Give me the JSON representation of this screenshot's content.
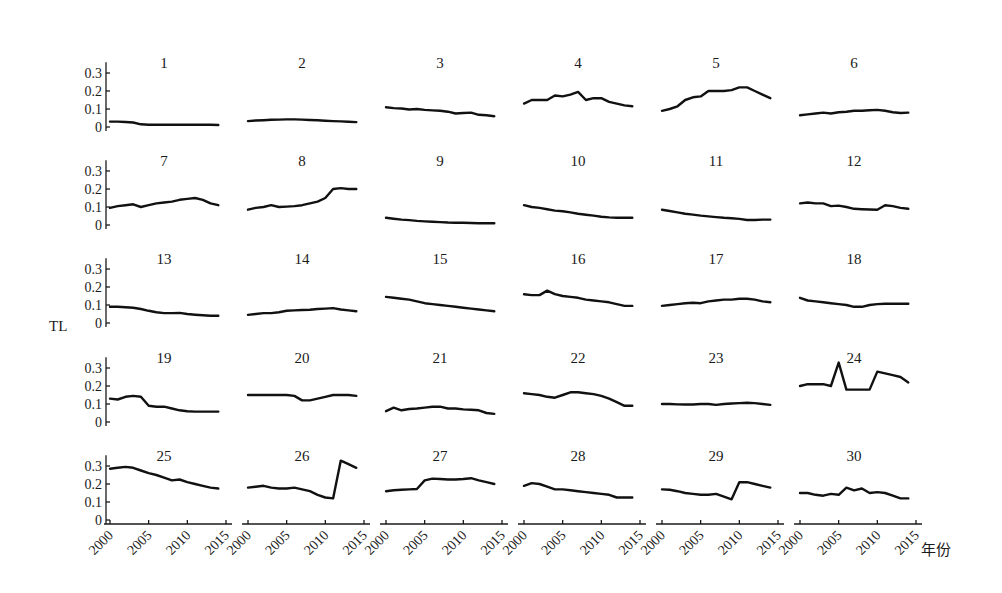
{
  "chart_data": {
    "type": "line",
    "layout": "small-multiples",
    "grid_rows": 5,
    "grid_cols": 6,
    "ylabel": "TL",
    "xlabel": "年份",
    "ylim": [
      0,
      0.35
    ],
    "yticks": [
      "0",
      "0.1",
      "0.2",
      "0.3"
    ],
    "xticks": [
      "2000",
      "2005",
      "2010",
      "2015"
    ],
    "x": [
      2000,
      2001,
      2002,
      2003,
      2004,
      2005,
      2006,
      2007,
      2008,
      2009,
      2010,
      2011,
      2012,
      2013,
      2014
    ],
    "grid": false,
    "legend": "none",
    "panels": [
      {
        "title": "1",
        "values": [
          0.03,
          0.03,
          0.028,
          0.025,
          0.015,
          0.013,
          0.013,
          0.013,
          0.013,
          0.013,
          0.013,
          0.013,
          0.013,
          0.012,
          0.011
        ]
      },
      {
        "title": "2",
        "values": [
          0.033,
          0.036,
          0.038,
          0.04,
          0.041,
          0.042,
          0.042,
          0.041,
          0.039,
          0.037,
          0.035,
          0.033,
          0.031,
          0.029,
          0.027
        ]
      },
      {
        "title": "3",
        "values": [
          0.11,
          0.105,
          0.103,
          0.097,
          0.1,
          0.095,
          0.092,
          0.09,
          0.085,
          0.075,
          0.078,
          0.08,
          0.068,
          0.065,
          0.06
        ]
      },
      {
        "title": "4",
        "values": [
          0.13,
          0.15,
          0.15,
          0.15,
          0.175,
          0.17,
          0.18,
          0.195,
          0.15,
          0.16,
          0.16,
          0.14,
          0.13,
          0.12,
          0.115
        ]
      },
      {
        "title": "5",
        "values": [
          0.09,
          0.1,
          0.115,
          0.15,
          0.165,
          0.17,
          0.2,
          0.2,
          0.2,
          0.205,
          0.22,
          0.22,
          0.2,
          0.18,
          0.16
        ]
      },
      {
        "title": "6",
        "values": [
          0.065,
          0.07,
          0.075,
          0.08,
          0.075,
          0.082,
          0.085,
          0.09,
          0.09,
          0.093,
          0.095,
          0.09,
          0.082,
          0.078,
          0.08
        ]
      },
      {
        "title": "7",
        "values": [
          0.095,
          0.105,
          0.11,
          0.115,
          0.1,
          0.11,
          0.12,
          0.125,
          0.13,
          0.14,
          0.145,
          0.15,
          0.14,
          0.12,
          0.11
        ]
      },
      {
        "title": "8",
        "values": [
          0.085,
          0.095,
          0.1,
          0.11,
          0.1,
          0.102,
          0.105,
          0.11,
          0.12,
          0.13,
          0.15,
          0.2,
          0.205,
          0.2,
          0.2
        ]
      },
      {
        "title": "9",
        "values": [
          0.04,
          0.035,
          0.03,
          0.027,
          0.023,
          0.02,
          0.018,
          0.016,
          0.014,
          0.013,
          0.012,
          0.011,
          0.01,
          0.01,
          0.01
        ]
      },
      {
        "title": "10",
        "values": [
          0.11,
          0.1,
          0.095,
          0.088,
          0.08,
          0.076,
          0.07,
          0.062,
          0.057,
          0.052,
          0.046,
          0.042,
          0.04,
          0.04,
          0.04
        ]
      },
      {
        "title": "11",
        "values": [
          0.085,
          0.078,
          0.07,
          0.063,
          0.058,
          0.052,
          0.048,
          0.044,
          0.04,
          0.037,
          0.034,
          0.028,
          0.028,
          0.03,
          0.03
        ]
      },
      {
        "title": "12",
        "values": [
          0.12,
          0.125,
          0.12,
          0.12,
          0.105,
          0.108,
          0.1,
          0.09,
          0.088,
          0.086,
          0.085,
          0.11,
          0.105,
          0.095,
          0.09
        ]
      },
      {
        "title": "13",
        "values": [
          0.09,
          0.09,
          0.088,
          0.085,
          0.078,
          0.068,
          0.06,
          0.055,
          0.055,
          0.056,
          0.05,
          0.046,
          0.043,
          0.04,
          0.04
        ]
      },
      {
        "title": "14",
        "values": [
          0.045,
          0.05,
          0.055,
          0.055,
          0.06,
          0.068,
          0.07,
          0.072,
          0.074,
          0.078,
          0.08,
          0.083,
          0.075,
          0.07,
          0.065
        ]
      },
      {
        "title": "15",
        "values": [
          0.145,
          0.14,
          0.135,
          0.13,
          0.12,
          0.11,
          0.105,
          0.1,
          0.095,
          0.09,
          0.085,
          0.08,
          0.075,
          0.07,
          0.065
        ]
      },
      {
        "title": "16",
        "values": [
          0.16,
          0.155,
          0.155,
          0.18,
          0.16,
          0.15,
          0.145,
          0.14,
          0.13,
          0.125,
          0.12,
          0.115,
          0.105,
          0.095,
          0.095
        ]
      },
      {
        "title": "17",
        "values": [
          0.095,
          0.1,
          0.105,
          0.11,
          0.112,
          0.11,
          0.12,
          0.125,
          0.13,
          0.13,
          0.135,
          0.135,
          0.13,
          0.12,
          0.115
        ]
      },
      {
        "title": "18",
        "values": [
          0.14,
          0.125,
          0.12,
          0.115,
          0.11,
          0.105,
          0.1,
          0.09,
          0.09,
          0.1,
          0.105,
          0.107,
          0.107,
          0.107,
          0.107
        ]
      },
      {
        "title": "19",
        "values": [
          0.13,
          0.125,
          0.14,
          0.145,
          0.14,
          0.09,
          0.085,
          0.085,
          0.075,
          0.065,
          0.06,
          0.058,
          0.058,
          0.058,
          0.058
        ]
      },
      {
        "title": "20",
        "values": [
          0.15,
          0.15,
          0.15,
          0.15,
          0.15,
          0.15,
          0.145,
          0.12,
          0.12,
          0.13,
          0.14,
          0.15,
          0.15,
          0.15,
          0.145
        ]
      },
      {
        "title": "21",
        "values": [
          0.06,
          0.08,
          0.065,
          0.072,
          0.075,
          0.08,
          0.085,
          0.085,
          0.075,
          0.075,
          0.07,
          0.068,
          0.065,
          0.05,
          0.045
        ]
      },
      {
        "title": "22",
        "values": [
          0.16,
          0.155,
          0.15,
          0.14,
          0.135,
          0.15,
          0.165,
          0.165,
          0.16,
          0.155,
          0.145,
          0.13,
          0.11,
          0.09,
          0.09
        ]
      },
      {
        "title": "23",
        "values": [
          0.1,
          0.1,
          0.098,
          0.097,
          0.097,
          0.1,
          0.1,
          0.095,
          0.1,
          0.103,
          0.105,
          0.107,
          0.105,
          0.1,
          0.095
        ]
      },
      {
        "title": "24",
        "values": [
          0.2,
          0.21,
          0.21,
          0.21,
          0.2,
          0.33,
          0.18,
          0.18,
          0.18,
          0.18,
          0.28,
          0.27,
          0.26,
          0.25,
          0.22
        ]
      },
      {
        "title": "25",
        "values": [
          0.285,
          0.29,
          0.295,
          0.29,
          0.275,
          0.26,
          0.25,
          0.235,
          0.22,
          0.225,
          0.21,
          0.2,
          0.19,
          0.18,
          0.175
        ]
      },
      {
        "title": "26",
        "values": [
          0.18,
          0.185,
          0.19,
          0.18,
          0.175,
          0.175,
          0.18,
          0.17,
          0.16,
          0.14,
          0.125,
          0.12,
          0.33,
          0.31,
          0.29
        ]
      },
      {
        "title": "27",
        "values": [
          0.16,
          0.165,
          0.168,
          0.17,
          0.172,
          0.22,
          0.23,
          0.228,
          0.225,
          0.225,
          0.228,
          0.232,
          0.22,
          0.21,
          0.2
        ]
      },
      {
        "title": "28",
        "values": [
          0.19,
          0.205,
          0.2,
          0.185,
          0.17,
          0.17,
          0.165,
          0.16,
          0.155,
          0.15,
          0.145,
          0.14,
          0.125,
          0.125,
          0.125
        ]
      },
      {
        "title": "29",
        "values": [
          0.17,
          0.168,
          0.16,
          0.15,
          0.145,
          0.14,
          0.14,
          0.145,
          0.13,
          0.115,
          0.21,
          0.21,
          0.2,
          0.19,
          0.18
        ]
      },
      {
        "title": "30",
        "values": [
          0.15,
          0.15,
          0.14,
          0.135,
          0.145,
          0.14,
          0.18,
          0.165,
          0.175,
          0.15,
          0.155,
          0.15,
          0.135,
          0.12,
          0.12
        ]
      }
    ]
  }
}
